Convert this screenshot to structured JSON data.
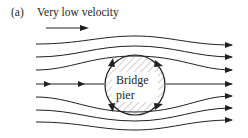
{
  "figure": {
    "panel_tag": "(a)",
    "title": "Very low velocity",
    "obstacle": {
      "label_line1": "Bridge",
      "label_line2": "pier",
      "shape": "circle",
      "fill": "hatched"
    },
    "flow_direction": "left-to-right",
    "streamline_count": 7,
    "colors": {
      "ink": "#231f20",
      "background": "#ffffff"
    }
  }
}
